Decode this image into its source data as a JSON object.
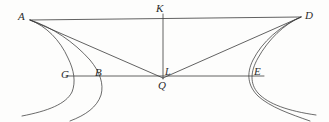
{
  "figure": {
    "background_color": "#fdfdfc",
    "stroke_color": "#3a3a3a",
    "points": [
      {
        "id": "A",
        "label": "A",
        "x": 30,
        "y": 20
      },
      {
        "id": "K",
        "label": "K",
        "x": 163,
        "y": 14
      },
      {
        "id": "D",
        "label": "D",
        "x": 301,
        "y": 17
      },
      {
        "id": "G",
        "label": "G",
        "x": 71,
        "y": 76
      },
      {
        "id": "B",
        "label": "B",
        "x": 107,
        "y": 76
      },
      {
        "id": "L",
        "label": "L",
        "x": 163,
        "y": 76
      },
      {
        "id": "Q",
        "label": "Q",
        "x": 163,
        "y": 79
      },
      {
        "id": "E",
        "label": "E",
        "x": 251,
        "y": 76
      }
    ],
    "segments": [
      {
        "name": "line-A-D",
        "from": "A",
        "to": "D"
      },
      {
        "name": "line-K-Q",
        "from": "K",
        "to": "Q"
      },
      {
        "name": "line-G-E",
        "from": "G",
        "to": "E"
      },
      {
        "name": "line-A-Q",
        "from": "A",
        "to": "Q"
      },
      {
        "name": "line-D-Q",
        "from": "D",
        "to": "Q"
      }
    ],
    "curves": [
      {
        "name": "curve-left-outer-through-G"
      },
      {
        "name": "curve-left-inner-through-B"
      },
      {
        "name": "curve-right-outer-through-E"
      },
      {
        "name": "curve-right-inner-through-E"
      }
    ]
  }
}
